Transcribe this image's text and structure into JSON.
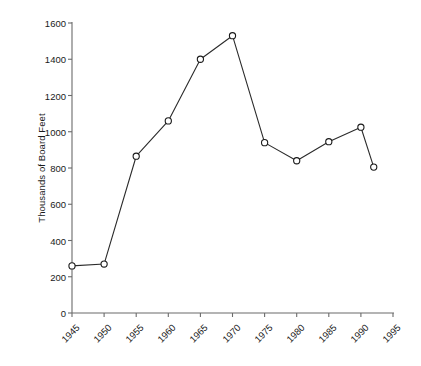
{
  "chart_data": {
    "type": "line",
    "title": "",
    "subtitle": "",
    "xlabel": "",
    "ylabel": "Thousands of Board Feet",
    "xlim": [
      1945,
      1995
    ],
    "ylim": [
      0,
      1600
    ],
    "x_ticks": [
      1945,
      1950,
      1955,
      1960,
      1965,
      1970,
      1975,
      1980,
      1985,
      1990,
      1995
    ],
    "x_tick_labels": [
      "1945",
      "1950",
      "1955",
      "1960",
      "1965",
      "1970",
      "1975",
      "1980",
      "1985",
      "1990",
      "1995"
    ],
    "y_ticks": [
      0,
      200,
      400,
      600,
      800,
      1000,
      1200,
      1400,
      1600
    ],
    "y_tick_labels": [
      "0",
      "200",
      "400",
      "600",
      "800",
      "1000",
      "1200",
      "1400",
      "1600"
    ],
    "grid": false,
    "legend": null,
    "marker": "open-circle",
    "line_color": "#2b2b2b",
    "marker_edge_color": "#1a1a1a",
    "marker_face_color": "#ffffff",
    "axis_color": "#6b6b6b",
    "background_color": "#ffffff",
    "x": [
      1945,
      1950,
      1955,
      1960,
      1965,
      1970,
      1975,
      1980,
      1985,
      1990,
      1992
    ],
    "values": [
      260,
      270,
      865,
      1060,
      1400,
      1530,
      940,
      840,
      945,
      1025,
      805
    ],
    "series": [
      {
        "name": "Board Feet Harvest",
        "x": [
          1945,
          1950,
          1955,
          1960,
          1965,
          1970,
          1975,
          1980,
          1985,
          1990,
          1992
        ],
        "values": [
          260,
          270,
          865,
          1060,
          1400,
          1530,
          940,
          840,
          945,
          1025,
          805
        ]
      }
    ],
    "annotations": []
  }
}
